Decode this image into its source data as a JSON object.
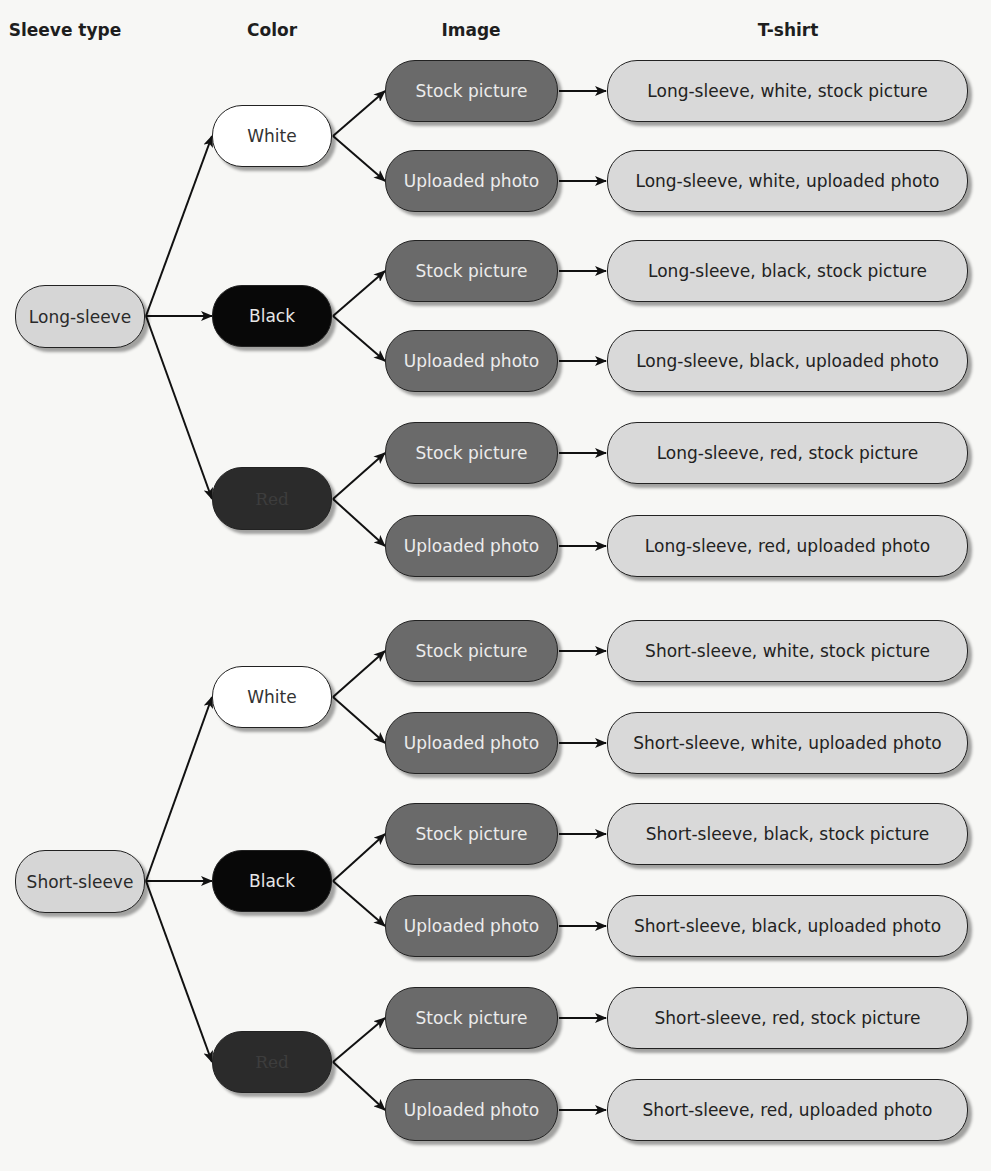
{
  "headers": {
    "sleeve": "Sleeve type",
    "color": "Color",
    "image": "Image",
    "tshirt": "T-shirt"
  },
  "colors": {
    "sleeve_fill": "#d6d6d6",
    "white_fill": "#ffffff",
    "black_fill": "#080808",
    "red_fill": "#2b2b2b",
    "image_fill": "#6a6a6a",
    "tshirt_fill": "#d9d9d9"
  },
  "sleeves": [
    {
      "label": "Long-sleeve",
      "colors": [
        {
          "label": "White",
          "images": [
            {
              "label": "Stock picture",
              "tshirt": "Long-sleeve, white, stock picture"
            },
            {
              "label": "Uploaded photo",
              "tshirt": "Long-sleeve, white, uploaded photo"
            }
          ]
        },
        {
          "label": "Black",
          "images": [
            {
              "label": "Stock picture",
              "tshirt": "Long-sleeve, black, stock picture"
            },
            {
              "label": "Uploaded photo",
              "tshirt": "Long-sleeve, black, uploaded photo"
            }
          ]
        },
        {
          "label": "Red",
          "images": [
            {
              "label": "Stock picture",
              "tshirt": "Long-sleeve, red, stock picture"
            },
            {
              "label": "Uploaded photo",
              "tshirt": "Long-sleeve, red, uploaded photo"
            }
          ]
        }
      ]
    },
    {
      "label": "Short-sleeve",
      "colors": [
        {
          "label": "White",
          "images": [
            {
              "label": "Stock picture",
              "tshirt": "Short-sleeve, white, stock picture"
            },
            {
              "label": "Uploaded photo",
              "tshirt": "Short-sleeve, white, uploaded photo"
            }
          ]
        },
        {
          "label": "Black",
          "images": [
            {
              "label": "Stock picture",
              "tshirt": "Short-sleeve, black, stock picture"
            },
            {
              "label": "Uploaded photo",
              "tshirt": "Short-sleeve, black, uploaded photo"
            }
          ]
        },
        {
          "label": "Red",
          "images": [
            {
              "label": "Stock picture",
              "tshirt": "Short-sleeve, red, stock picture"
            },
            {
              "label": "Uploaded photo",
              "tshirt": "Short-sleeve, red, uploaded photo"
            }
          ]
        }
      ]
    }
  ]
}
